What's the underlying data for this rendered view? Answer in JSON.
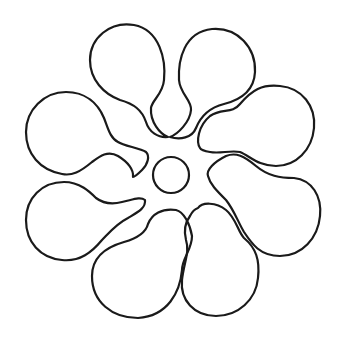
{
  "figure": {
    "title": "Flower outline with eight petals",
    "stroke_color": "#1a1a1a",
    "background_color": "#ffffff",
    "center": {
      "x": 171,
      "y": 175,
      "r": 18
    },
    "petal_count": 8,
    "petals": [
      {
        "name": "petal-top-left",
        "d": "M168,137 C160,132 150,120 152,105 C155,98 165,90 164,70 C160,45 148,26 128,24 C108,23 92,36 90,58 C88,78 100,92 115,98 C130,102 140,110 148,120 C154,128 162,136 168,137 Z"
      },
      {
        "name": "petal-top-right",
        "d": "M170,137 C178,134 188,124 192,112 C194,104 184,98 180,88 C176,70 180,40 205,31 C232,22 254,42 255,68 C256,90 240,100 225,103 C208,107 198,120 194,130 C190,138 178,140 170,137 Z"
      }
    ]
  }
}
